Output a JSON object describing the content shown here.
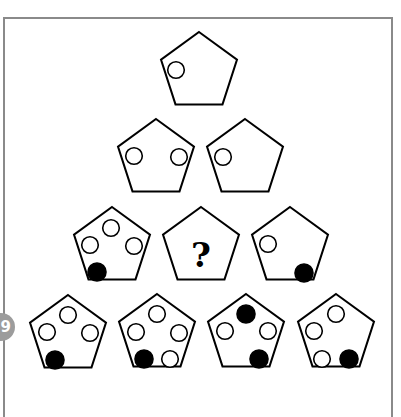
{
  "puzzle": {
    "question_number": "9",
    "question_mark": "?",
    "colors": {
      "stroke": "#000000",
      "filled": "#000000",
      "hollow": "#ffffff",
      "frame": "#8a8a8a",
      "badge": "#9c9c9c"
    },
    "rows": [
      {
        "row": 1,
        "pentagons": [
          {
            "id": "r1p1",
            "cx": 199,
            "cy": 72,
            "circles": [
              {
                "x": 176,
                "y": 70,
                "filled": false
              }
            ]
          }
        ]
      },
      {
        "row": 2,
        "pentagons": [
          {
            "id": "r2p1",
            "cx": 156,
            "cy": 159,
            "circles": [
              {
                "x": 134,
                "y": 156,
                "filled": false
              },
              {
                "x": 179,
                "y": 157,
                "filled": false
              }
            ]
          },
          {
            "id": "r2p2",
            "cx": 245,
            "cy": 159,
            "circles": [
              {
                "x": 223,
                "y": 157,
                "filled": false
              }
            ]
          }
        ]
      },
      {
        "row": 3,
        "pentagons": [
          {
            "id": "r3p1",
            "cx": 112,
            "cy": 247,
            "circles": [
              {
                "x": 111,
                "y": 228,
                "filled": false
              },
              {
                "x": 90,
                "y": 245,
                "filled": false
              },
              {
                "x": 134,
                "y": 246,
                "filled": false
              },
              {
                "x": 97,
                "y": 272,
                "filled": true
              }
            ]
          },
          {
            "id": "r3p2",
            "cx": 201,
            "cy": 247,
            "question": true,
            "circles": []
          },
          {
            "id": "r3p3",
            "cx": 290,
            "cy": 247,
            "circles": [
              {
                "x": 268,
                "y": 244,
                "filled": false
              },
              {
                "x": 304,
                "y": 273,
                "filled": true
              }
            ]
          }
        ]
      },
      {
        "row": 4,
        "pentagons": [
          {
            "id": "r4p1",
            "cx": 68,
            "cy": 335,
            "circles": [
              {
                "x": 68,
                "y": 315,
                "filled": false
              },
              {
                "x": 47,
                "y": 332,
                "filled": false
              },
              {
                "x": 90,
                "y": 333,
                "filled": false
              },
              {
                "x": 55,
                "y": 360,
                "filled": true
              }
            ]
          },
          {
            "id": "r4p2",
            "cx": 157,
            "cy": 334,
            "circles": [
              {
                "x": 157,
                "y": 314,
                "filled": false
              },
              {
                "x": 136,
                "y": 332,
                "filled": false
              },
              {
                "x": 179,
                "y": 333,
                "filled": false
              },
              {
                "x": 144,
                "y": 359,
                "filled": true
              },
              {
                "x": 170,
                "y": 359,
                "filled": false
              }
            ]
          },
          {
            "id": "r4p3",
            "cx": 246,
            "cy": 334,
            "circles": [
              {
                "x": 246,
                "y": 314,
                "filled": true
              },
              {
                "x": 225,
                "y": 331,
                "filled": false
              },
              {
                "x": 268,
                "y": 331,
                "filled": false
              },
              {
                "x": 259,
                "y": 359,
                "filled": true
              }
            ]
          },
          {
            "id": "r4p4",
            "cx": 336,
            "cy": 334,
            "circles": [
              {
                "x": 336,
                "y": 314,
                "filled": false
              },
              {
                "x": 314,
                "y": 331,
                "filled": false
              },
              {
                "x": 322,
                "y": 359,
                "filled": false
              },
              {
                "x": 349,
                "y": 359,
                "filled": true
              }
            ]
          }
        ]
      }
    ]
  }
}
